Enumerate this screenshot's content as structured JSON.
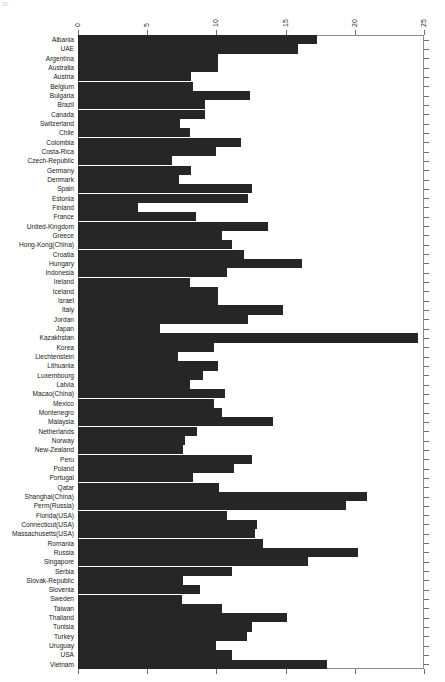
{
  "corner_artifact": "20 :",
  "chart_data": {
    "type": "bar",
    "orientation": "horizontal",
    "title": "",
    "subtitle": "",
    "xlabel": "",
    "ylabel": "",
    "xlim": [
      0,
      25
    ],
    "xticks": [
      0,
      5,
      10,
      15,
      20,
      25
    ],
    "xtick_labels": [
      "0",
      "5",
      "10",
      "15",
      "20",
      "25"
    ],
    "xtick_label_rotation": -90,
    "grid": false,
    "legend": "none",
    "bar_color": "#262626",
    "frame_color": "#8a8a8a",
    "categories": [
      "Albania",
      "UAE",
      "Argentina",
      "Australia",
      "Austria",
      "Belgium",
      "Bulgaria",
      "Brazil",
      "Canada",
      "Switzerland",
      "Chile",
      "Colombia",
      "Costa-Rica",
      "Czech-Republic",
      "Germany",
      "Denmark",
      "Spain",
      "Estonia",
      "Finland",
      "France",
      "United-Kingdom",
      "Greece",
      "Hong-Kong(China)",
      "Croatia",
      "Hungary",
      "Indonesia",
      "Ireland",
      "Iceland",
      "Israel",
      "Italy",
      "Jordan",
      "Japan",
      "Kazakhstan",
      "Korea",
      "Liechtenstein",
      "Lithuania",
      "Luxembourg",
      "Latvia",
      "Macao(China)",
      "Mexico",
      "Montenegro",
      "Malaysia",
      "Netherlands",
      "Norway",
      "New-Zealand",
      "Peru",
      "Poland",
      "Portugal",
      "Qatar",
      "Shanghai(China)",
      "Perm(Russia)",
      "Florida(USA)",
      "Connecticut(USA)",
      "Massachusetts(USA)",
      "Romania",
      "Russia",
      "Singapore",
      "Serbia",
      "Slovak-Republic",
      "Slovenia",
      "Sweden",
      "Taiwan",
      "Thailand",
      "Tunisia",
      "Turkey",
      "Uruguay",
      "USA",
      "Vietnam"
    ],
    "values": [
      17.3,
      15.9,
      10.1,
      10.1,
      8.2,
      8.3,
      12.4,
      9.2,
      9.2,
      7.4,
      8.1,
      11.8,
      10.0,
      6.8,
      8.2,
      7.3,
      12.6,
      12.3,
      4.3,
      8.5,
      13.7,
      10.4,
      11.1,
      12.0,
      16.2,
      10.8,
      8.1,
      10.1,
      10.1,
      14.8,
      12.3,
      5.9,
      24.6,
      9.8,
      7.2,
      10.1,
      9.0,
      8.1,
      10.6,
      9.8,
      10.4,
      14.1,
      8.6,
      7.7,
      7.6,
      12.6,
      11.3,
      8.3,
      10.2,
      20.9,
      19.4,
      10.8,
      12.9,
      12.8,
      13.4,
      20.2,
      16.6,
      11.1,
      7.6,
      8.8,
      7.5,
      10.4,
      15.1,
      12.6,
      12.2,
      10.0,
      11.1,
      18.0
    ]
  }
}
